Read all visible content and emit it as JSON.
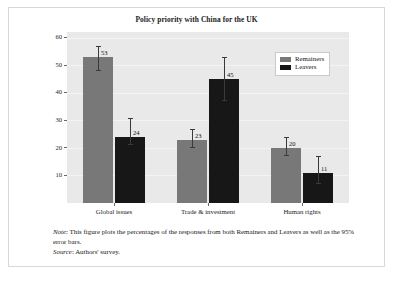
{
  "chart_data": {
    "type": "bar",
    "title": "Policy priority with China for the UK",
    "xlabel": "",
    "ylabel": "",
    "ylim": [
      0,
      62
    ],
    "yticks": [
      10,
      20,
      30,
      40,
      50,
      60
    ],
    "grid": true,
    "legend_position": "top-right",
    "categories": [
      "Global issues",
      "Trade & investment",
      "Human rights"
    ],
    "series": [
      {
        "name": "Remainers",
        "color": "#787878",
        "values": [
          53,
          23,
          20
        ],
        "errors_low": [
          48,
          20,
          17
        ],
        "errors_high": [
          57,
          27,
          24
        ]
      },
      {
        "name": "Leavers",
        "color": "#171717",
        "values": [
          24,
          45,
          11
        ],
        "errors_low": [
          21,
          37,
          7
        ],
        "errors_high": [
          31,
          53,
          17
        ]
      }
    ]
  },
  "notes": {
    "note_lead": "Note",
    "note_text": ": This figure plots the percentages of the responses from both Remainers and Leavers as well as the 95% error bars.",
    "source_lead": "Source",
    "source_text": ": Authors' survey."
  }
}
